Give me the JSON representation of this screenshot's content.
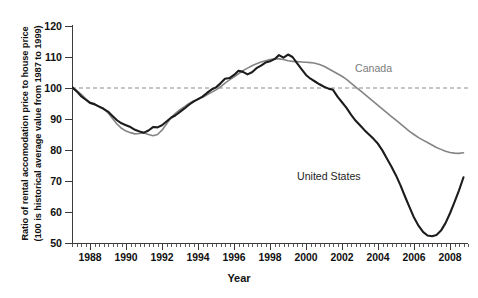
{
  "figure": {
    "background": "#ffffff"
  },
  "axes": {
    "y_title_line1": "Ratio of rental accomodation price to house price",
    "y_title_line2": "(100 is historical average value from 1987 to 1999)",
    "x_title": "Year",
    "y_ticks": [
      120,
      110,
      100,
      90,
      80,
      70,
      60,
      50
    ],
    "x_ticks": [
      1988,
      1990,
      1992,
      1994,
      1996,
      1998,
      2000,
      2002,
      2004,
      2006,
      2008
    ]
  },
  "labels": {
    "canada": "Canada",
    "united_states": "United States"
  },
  "colors": {
    "united_states": "#1c1c1c",
    "canada": "#848484",
    "reference_line": "#8c8c8c",
    "axis": "#3b3b3b"
  },
  "chart_data": {
    "type": "line",
    "title": "",
    "xlabel": "Year",
    "ylabel": "Ratio of rental accomodation price to house price (100 is historical average value from 1987 to 1999)",
    "xlim": [
      1987.0,
      2009.0
    ],
    "ylim": [
      50,
      120
    ],
    "grid": false,
    "legend_position": "inline-annotations",
    "reference_lines": [
      {
        "type": "horizontal",
        "value": 100,
        "style": "dashed",
        "color": "#8c8c8c"
      }
    ],
    "x": [
      1987.0,
      1987.25,
      1987.5,
      1987.75,
      1988.0,
      1988.25,
      1988.5,
      1988.75,
      1989.0,
      1989.25,
      1989.5,
      1989.75,
      1990.0,
      1990.25,
      1990.5,
      1990.75,
      1991.0,
      1991.25,
      1991.5,
      1991.75,
      1992.0,
      1992.25,
      1992.5,
      1992.75,
      1993.0,
      1993.25,
      1993.5,
      1993.75,
      1994.0,
      1994.25,
      1994.5,
      1994.75,
      1995.0,
      1995.25,
      1995.5,
      1995.75,
      1996.0,
      1996.25,
      1996.5,
      1996.75,
      1997.0,
      1997.25,
      1997.5,
      1997.75,
      1998.0,
      1998.25,
      1998.5,
      1998.75,
      1999.0,
      1999.25,
      1999.5,
      1999.75,
      2000.0,
      2000.25,
      2000.5,
      2000.75,
      2001.0,
      2001.25,
      2001.5,
      2001.75,
      2002.0,
      2002.25,
      2002.5,
      2002.75,
      2003.0,
      2003.25,
      2003.5,
      2003.75,
      2004.0,
      2004.25,
      2004.5,
      2004.75,
      2005.0,
      2005.25,
      2005.5,
      2005.75,
      2006.0,
      2006.25,
      2006.5,
      2006.75,
      2007.0,
      2007.25,
      2007.5,
      2007.75,
      2008.0,
      2008.25,
      2008.5,
      2008.75
    ],
    "series": [
      {
        "name": "United States",
        "color": "#1c1c1c",
        "linewidth": 2.0,
        "values": [
          100.3,
          99.0,
          97.4,
          96.3,
          95.2,
          94.8,
          94.0,
          93.3,
          92.4,
          91.0,
          89.6,
          88.6,
          88.0,
          87.4,
          86.5,
          86.0,
          85.6,
          86.3,
          87.4,
          87.3,
          88.0,
          89.2,
          90.4,
          91.2,
          92.3,
          93.4,
          94.6,
          95.6,
          96.4,
          97.2,
          98.4,
          99.5,
          100.2,
          101.5,
          103.0,
          103.2,
          104.2,
          105.6,
          105.2,
          104.4,
          105.1,
          106.4,
          107.2,
          108.2,
          108.6,
          109.3,
          110.6,
          109.8,
          110.8,
          110.0,
          108.0,
          106.1,
          104.2,
          103.0,
          102.1,
          101.2,
          100.4,
          99.8,
          99.4,
          97.2,
          95.4,
          93.6,
          91.4,
          89.5,
          88.0,
          86.4,
          85.0,
          83.6,
          82.0,
          79.8,
          77.2,
          74.6,
          71.8,
          68.6,
          65.0,
          61.6,
          58.2,
          55.6,
          53.6,
          52.4,
          52.2,
          52.6,
          54.0,
          56.4,
          59.6,
          63.2,
          67.0,
          71.2
        ]
      },
      {
        "name": "Canada",
        "color": "#848484",
        "linewidth": 1.5,
        "values": [
          100.1,
          99.2,
          98.0,
          96.6,
          95.4,
          94.6,
          94.1,
          93.4,
          92.0,
          90.2,
          88.4,
          87.0,
          86.1,
          85.6,
          85.2,
          85.3,
          85.5,
          85.0,
          84.6,
          85.0,
          86.4,
          88.4,
          90.4,
          91.8,
          93.0,
          94.0,
          95.0,
          95.8,
          96.4,
          97.0,
          97.8,
          98.6,
          99.4,
          100.4,
          101.6,
          102.6,
          103.6,
          104.6,
          105.6,
          106.4,
          107.2,
          107.8,
          108.4,
          108.8,
          109.2,
          109.4,
          109.4,
          109.2,
          108.8,
          108.6,
          108.5,
          108.4,
          108.3,
          108.2,
          108.0,
          107.6,
          107.0,
          106.2,
          105.4,
          104.6,
          103.8,
          102.8,
          101.6,
          100.4,
          99.2,
          98.0,
          96.8,
          95.6,
          94.4,
          93.2,
          92.0,
          90.8,
          89.6,
          88.4,
          87.2,
          86.0,
          85.0,
          84.0,
          83.2,
          82.4,
          81.6,
          80.8,
          80.2,
          79.6,
          79.2,
          79.0,
          78.9,
          79.1
        ]
      }
    ],
    "annotations": [
      {
        "text": "Canada",
        "x": 2003.0,
        "y": 106.0,
        "color": "#7c7c7c"
      },
      {
        "text": "United States",
        "x": 2000.0,
        "y": 75.0,
        "color": "#232323"
      }
    ]
  }
}
